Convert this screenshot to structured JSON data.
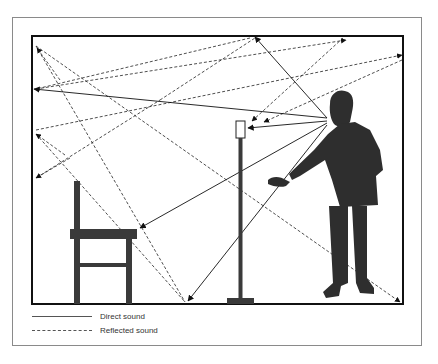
{
  "diagram": {
    "elements": [
      "room",
      "chair",
      "microphone-stand",
      "microphone",
      "speaker-person"
    ],
    "colors": {
      "ink": "#222222",
      "figure": "#333333",
      "frame": "#8a8a8a",
      "background": "#ffffff"
    }
  },
  "legend": {
    "items": [
      {
        "style": "solid",
        "label": "Direct sound"
      },
      {
        "style": "dashed",
        "label": "Reflected sound"
      }
    ]
  }
}
